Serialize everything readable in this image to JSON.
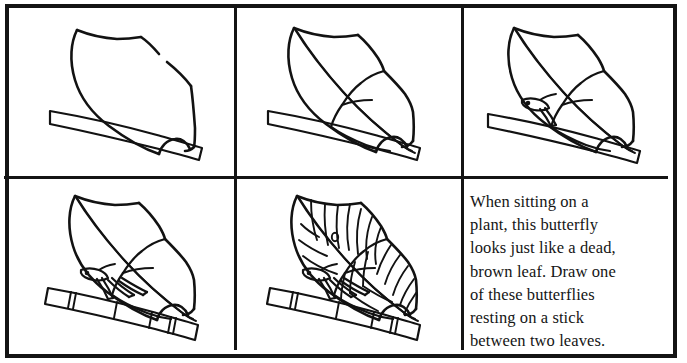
{
  "page": {
    "kind": "step-by-step-drawing-tutorial",
    "background_color": "#ffffff",
    "ink_color": "#121212",
    "border_color": "#141414",
    "grid": {
      "columns": 3,
      "rows": 2,
      "cells": 6
    }
  },
  "panels": [
    {
      "id": "step-1",
      "position": "row-1-col-1",
      "description": "Basic leaf-shaped wing outline above a tapered stick"
    },
    {
      "id": "step-2",
      "position": "row-1-col-2",
      "description": "Add the midrib line and divide the shape into forewing and hindwing"
    },
    {
      "id": "step-3",
      "position": "row-1-col-3",
      "description": "Add the head, antenna and a front leg gripping the stick"
    },
    {
      "id": "step-4",
      "position": "row-2-col-1",
      "description": "Add the remaining legs and segment lines on the stick"
    },
    {
      "id": "step-5",
      "position": "row-2-col-2",
      "description": "Finish with wing veins and the small eyespot"
    },
    {
      "id": "caption-panel",
      "position": "row-2-col-3",
      "description": "Instruction text"
    }
  ],
  "caption": {
    "lines": [
      "When sitting on a",
      "plant, this butterfly",
      "looks just like a dead,",
      "brown leaf. Draw one",
      "of these butterflies",
      "resting on a stick",
      "between two leaves."
    ],
    "full_text": "When sitting on a plant, this butterfly looks just like a dead, brown leaf. Draw one of these butterflies resting on a stick between two leaves."
  }
}
